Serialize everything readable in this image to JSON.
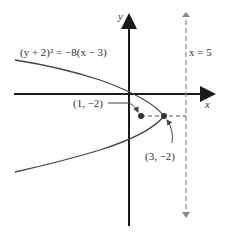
{
  "diagram": {
    "equation": "(y + 2)² = −8(x − 3)",
    "axis_x_label": "x",
    "axis_y_label": "y",
    "directrix_label": "x = 5",
    "focus_label": "(1, −2)",
    "vertex_label": "(3, −2)",
    "colors": {
      "axis": "#1a1a1a",
      "curve": "#444444",
      "dashed": "#777777",
      "point": "#333333"
    }
  }
}
